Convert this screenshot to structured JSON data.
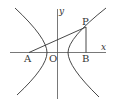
{
  "diagram": {
    "type": "hyperbola",
    "axes": {
      "x_label": "x",
      "y_label": "y"
    },
    "points": [
      {
        "name": "A",
        "label": "A"
      },
      {
        "name": "O",
        "label": "O"
      },
      {
        "name": "B",
        "label": "B"
      },
      {
        "name": "P",
        "label": "P"
      }
    ],
    "segments": [
      "AP",
      "PB"
    ],
    "colors": {
      "stroke": "#333333",
      "background": "#ffffff"
    }
  }
}
